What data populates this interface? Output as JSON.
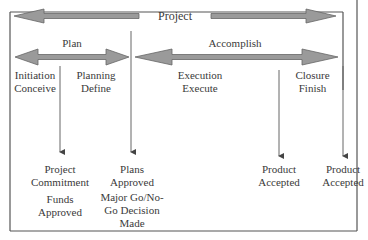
{
  "colors": {
    "arrow_fill": "#9a9a9a",
    "arrow_stroke": "#555555",
    "line": "#555555",
    "text": "#3a3a3a",
    "background": "#ffffff"
  },
  "top_band": {
    "label": "Project"
  },
  "phases_group": {
    "plan": {
      "label": "Plan"
    },
    "accomplish": {
      "label": "Accomplish"
    }
  },
  "phases": [
    {
      "line1": "Initiation",
      "line2": "Conceive"
    },
    {
      "line1": "Planning",
      "line2": "Define"
    },
    {
      "line1": "Execution",
      "line2": "Execute"
    },
    {
      "line1": "Closure",
      "line2": "Finish"
    }
  ],
  "milestones": [
    {
      "line1": "Project",
      "line2": "Commitment",
      "sub1": "Funds",
      "sub2": "Approved"
    },
    {
      "line1": "Plans",
      "line2": "Approved",
      "sub1": "Major Go/No-",
      "sub2": "Go Decision",
      "sub3": "Made"
    },
    {
      "line1": "Product",
      "line2": "Accepted"
    },
    {
      "line1": "Product",
      "line2": "Accepted"
    }
  ]
}
